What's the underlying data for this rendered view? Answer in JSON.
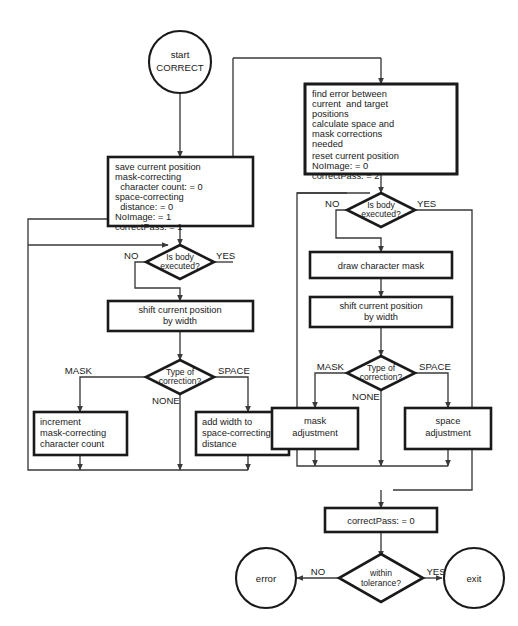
{
  "diagram": {
    "colors": {
      "background": "#ffffff",
      "shape_fill": "#ffffff",
      "shape_stroke": "#1a1a1a",
      "connector_stroke": "#3a3a3a",
      "text": "#1a1a1a"
    }
  },
  "nodes": {
    "start": {
      "type": "terminator",
      "lines": [
        "start",
        "CORRECT"
      ]
    },
    "save_current_position": {
      "type": "process",
      "lines": [
        "save current position",
        "mask-correcting",
        "  character count: = 0",
        "space-correcting",
        "  distance: = 0",
        "NoImage: = 1",
        "correctPass: = 1"
      ]
    },
    "find_error": {
      "type": "process",
      "lines": [
        "find error between",
        "current  and target",
        "positions",
        "calculate space and",
        "mask corrections",
        "needed",
        "",
        "reset current position",
        "NoImage: = 0",
        "correctPass: = 2"
      ]
    },
    "is_body_executed_left": {
      "type": "decision",
      "lines": [
        "Is body",
        "executed?"
      ],
      "branch_no": "NO",
      "branch_yes": "YES"
    },
    "is_body_executed_right": {
      "type": "decision",
      "lines": [
        "Is body",
        "executed?"
      ],
      "branch_no": "NO",
      "branch_yes": "YES"
    },
    "shift_current_position_left": {
      "type": "process",
      "lines": [
        "shift current position",
        "by width"
      ]
    },
    "draw_character_mask": {
      "type": "process",
      "lines": [
        "draw character mask"
      ]
    },
    "shift_current_position_right": {
      "type": "process",
      "lines": [
        "shift current position",
        "by width"
      ]
    },
    "type_of_correction_left": {
      "type": "decision",
      "lines": [
        "Type of",
        "correction?"
      ],
      "branch_mask": "MASK",
      "branch_space": "SPACE",
      "branch_none": "NONE"
    },
    "type_of_correction_right": {
      "type": "decision",
      "lines": [
        "Type of",
        "correction?"
      ],
      "branch_mask": "MASK",
      "branch_space": "SPACE",
      "branch_none": "NONE"
    },
    "increment_mask": {
      "type": "process",
      "lines": [
        "increment",
        "mask-correcting",
        "character count"
      ]
    },
    "add_width_space": {
      "type": "process",
      "lines": [
        "add width to",
        "space-correcting",
        "distance"
      ]
    },
    "mask_adjustment": {
      "type": "process",
      "lines": [
        "mask",
        "adjustment"
      ]
    },
    "space_adjustment": {
      "type": "process",
      "lines": [
        "space",
        "adjustment"
      ]
    },
    "correct_pass_zero": {
      "type": "process",
      "lines": [
        "correctPass: = 0"
      ]
    },
    "within_tolerance": {
      "type": "decision",
      "lines": [
        "within",
        "tolerance?"
      ],
      "branch_no": "NO",
      "branch_yes": "YES"
    },
    "error": {
      "type": "terminator",
      "lines": [
        "error"
      ]
    },
    "exit": {
      "type": "terminator",
      "lines": [
        "exit"
      ]
    }
  },
  "edge_labels": {
    "left_body_no": "NO",
    "left_body_yes": "YES",
    "right_body_no": "NO",
    "right_body_yes": "YES",
    "left_corr_mask": "MASK",
    "left_corr_space": "SPACE",
    "left_corr_none": "NONE",
    "right_corr_mask": "MASK",
    "right_corr_space": "SPACE",
    "right_corr_none": "NONE",
    "tol_no": "NO",
    "tol_yes": "YES"
  }
}
